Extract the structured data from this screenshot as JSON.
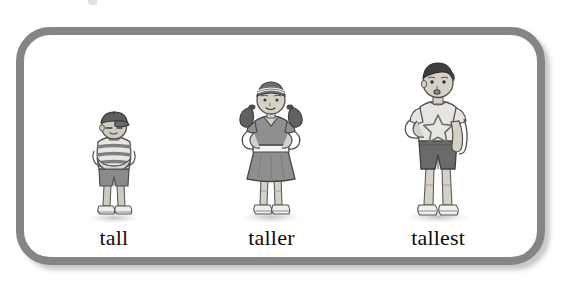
{
  "page": {
    "background_color": "#ffffff",
    "width": 571,
    "height": 281
  },
  "panel": {
    "border_color": "#858585",
    "border_width": 8,
    "corner_radius": 34,
    "fill_color": "#ffffff",
    "shadow_color": "#787878"
  },
  "illustration": {
    "style": "grayscale pencil sketch",
    "topic": "comparative adjectives of height",
    "ground_shadow_color": "#d0d0d0"
  },
  "figures": [
    {
      "label": "tall",
      "name": "boy-short",
      "rank": 1,
      "description": "shortest boy wearing a baseball cap, striped shirt, arms crossed, shorts and sneakers",
      "skin_color": "#cfcabf",
      "hair_color": "#4a4a4a",
      "cap_color": "#5e5e5e",
      "shirt_color": "#e8e6e2",
      "stripe_color": "#7f7f7f",
      "shorts_color": "#8a8a8a",
      "shoe_color": "#efeeea",
      "height_px": 118
    },
    {
      "label": "taller",
      "name": "girl-medium",
      "rank": 2,
      "description": "girl with pigtails and a headband, dress with white belt, hands on hips, sneakers",
      "skin_color": "#d6d1c7",
      "hair_color": "#616161",
      "headband_color": "#efefeb",
      "dress_color": "#8f8f8f",
      "belt_color": "#f4f4f1",
      "shoe_color": "#efeeea",
      "height_px": 145
    },
    {
      "label": "tallest",
      "name": "boy-tall",
      "rank": 3,
      "description": "tallest boy with dark hair, light t-shirt with a star, dark shorts, sneakers, one hand on hip",
      "skin_color": "#d6d1c7",
      "hair_color": "#3f3f3f",
      "shirt_color": "#e7e5e1",
      "shirt_motif": "star",
      "shorts_color": "#6a6a6a",
      "shoe_color": "#f1f0ec",
      "height_px": 163
    }
  ]
}
